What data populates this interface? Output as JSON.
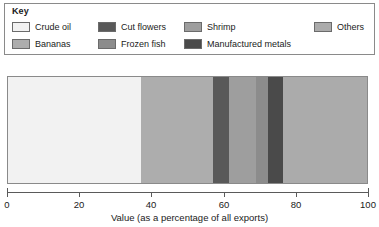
{
  "legend": {
    "title": "Key",
    "rows": [
      [
        {
          "label": "Crude oil",
          "color": "#F2F2F2"
        },
        {
          "label": "Cut flowers",
          "color": "#595959"
        },
        {
          "label": "Shrimp",
          "color": "#9E9E9E"
        },
        {
          "label": "Others",
          "color": "#ABABAB"
        }
      ],
      [
        {
          "label": "Bananas",
          "color": "#ADADAD"
        },
        {
          "label": "Frozen fish",
          "color": "#8C8C8C"
        },
        {
          "label": "Manufactured metals",
          "color": "#4A4A4A"
        }
      ]
    ]
  },
  "axis": {
    "title": "Value (as a percentage of all exports)",
    "ticks": [
      "0",
      "20",
      "40",
      "60",
      "80",
      "100"
    ],
    "min": 0,
    "max": 100
  },
  "chart_data": {
    "type": "bar",
    "orientation": "horizontal",
    "stacked": true,
    "title": "",
    "xlabel": "Value (as a percentage of all exports)",
    "ylabel": "",
    "xlim": [
      0,
      100
    ],
    "xticks": [
      0,
      20,
      40,
      60,
      80,
      100
    ],
    "grid": false,
    "legend_position": "top",
    "categories": [
      ""
    ],
    "series": [
      {
        "name": "Crude oil",
        "values": [
          37.0
        ],
        "color": "#F2F2F2",
        "start": 0.0,
        "end": 37.0
      },
      {
        "name": "Bananas",
        "values": [
          20.0
        ],
        "color": "#ADADAD",
        "start": 37.0,
        "end": 57.0
      },
      {
        "name": "Cut flowers",
        "values": [
          4.5
        ],
        "color": "#595959",
        "start": 57.0,
        "end": 61.5
      },
      {
        "name": "Shrimp",
        "values": [
          7.5
        ],
        "color": "#9E9E9E",
        "start": 61.5,
        "end": 69.0
      },
      {
        "name": "Frozen fish",
        "values": [
          3.5
        ],
        "color": "#8C8C8C",
        "start": 69.0,
        "end": 72.5
      },
      {
        "name": "Manufactured metals",
        "values": [
          4.0
        ],
        "color": "#4A4A4A",
        "start": 72.5,
        "end": 76.5
      },
      {
        "name": "Others",
        "values": [
          23.5
        ],
        "color": "#ABABAB",
        "start": 76.5,
        "end": 100.0
      }
    ]
  }
}
